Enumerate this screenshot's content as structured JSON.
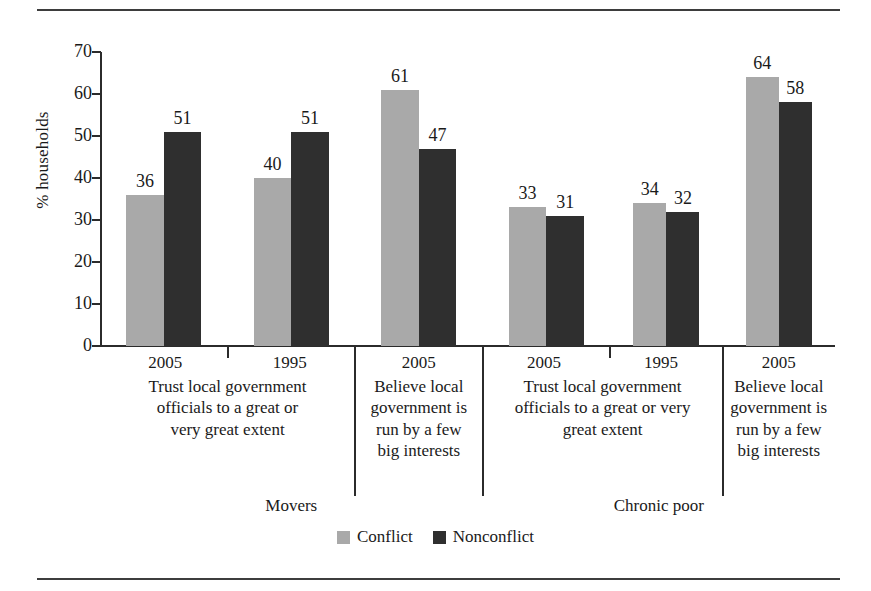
{
  "chart_data": {
    "type": "bar",
    "title": "",
    "xlabel": "",
    "ylabel": "% households",
    "ylim": [
      0,
      70
    ],
    "yticks": [
      0,
      10,
      20,
      30,
      40,
      50,
      60,
      70
    ],
    "grid": false,
    "legend_position": "bottom-center",
    "series": [
      {
        "name": "Conflict",
        "color": "#a9a9a9",
        "values": [
          36,
          40,
          61,
          33,
          34,
          64
        ]
      },
      {
        "name": "Nonconflict",
        "color": "#2f2f2f",
        "values": [
          51,
          51,
          47,
          31,
          32,
          58
        ]
      }
    ],
    "categories": [
      "2005",
      "1995",
      "2005",
      "2005",
      "1995",
      "2005"
    ],
    "category_captions": [
      "Trust local government officials to a great or very great extent",
      "Trust local government officials to a great or very great extent",
      "Believe local government is run by a few big interests",
      "Trust local government officials to a great or very great extent",
      "Trust local government officials to a great or very great extent",
      "Believe local government is run by a few big interests"
    ],
    "supergroups": [
      "Movers",
      "Chronic poor"
    ]
  },
  "axis": {
    "ylabel": "% households",
    "ticks": [
      "70",
      "60",
      "50",
      "40",
      "30",
      "20",
      "10",
      "0"
    ]
  },
  "groups": [
    {
      "caption_lines": [
        "Trust local government",
        "officials to a great or",
        "very great extent"
      ],
      "years": [
        "2005",
        "1995"
      ],
      "bars": [
        {
          "year": "2005",
          "conflict": "36",
          "nonconflict": "51"
        },
        {
          "year": "1995",
          "conflict": "40",
          "nonconflict": "51"
        }
      ]
    },
    {
      "caption_lines": [
        "Believe local",
        "government is",
        "run by a few",
        "big interests"
      ],
      "years": [
        "2005"
      ],
      "bars": [
        {
          "year": "2005",
          "conflict": "61",
          "nonconflict": "47"
        }
      ]
    },
    {
      "caption_lines": [
        "Trust local government",
        "officials to a great or very",
        "great extent"
      ],
      "years": [
        "2005",
        "1995"
      ],
      "bars": [
        {
          "year": "2005",
          "conflict": "33",
          "nonconflict": "31"
        },
        {
          "year": "1995",
          "conflict": "34",
          "nonconflict": "32"
        }
      ]
    },
    {
      "caption_lines": [
        "Believe local",
        "government is",
        "run by a few",
        "big interests"
      ],
      "years": [
        "2005"
      ],
      "bars": [
        {
          "year": "2005",
          "conflict": "64",
          "nonconflict": "58"
        }
      ]
    }
  ],
  "supergroups": [
    {
      "label": "Movers"
    },
    {
      "label": "Chronic poor"
    }
  ],
  "legend": {
    "items": [
      {
        "label": "Conflict",
        "color": "#a9a9a9"
      },
      {
        "label": "Nonconflict",
        "color": "#2f2f2f"
      }
    ]
  }
}
